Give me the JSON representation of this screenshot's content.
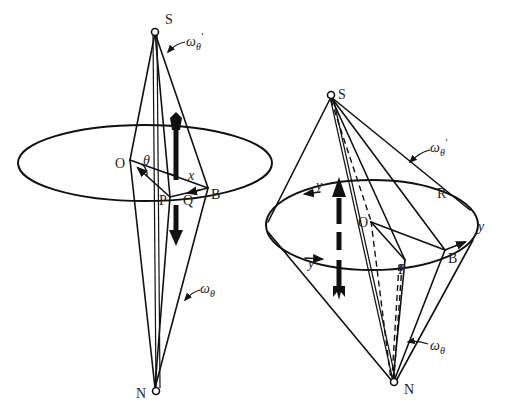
{
  "figure": {
    "left_diagram": {
      "labels": {
        "top_pole": "S",
        "bottom_pole": "N",
        "center": "O",
        "point_p": "P",
        "point_q": "Q",
        "point_b": "B",
        "angle": "θ",
        "distance": "x",
        "omega_top": "ω",
        "omega_top_sub": "θ",
        "omega_top_prime": "′",
        "omega_bottom": "ω",
        "omega_bottom_sub": "θ"
      }
    },
    "right_diagram": {
      "labels": {
        "top_pole": "S",
        "bottom_pole": "N",
        "center": "O",
        "point_p": "P",
        "point_b": "B",
        "point_r": "R",
        "y_left_top": "y",
        "y_left_bottom": "y",
        "y_right": "y",
        "omega_top": "ω",
        "omega_top_sub": "θ",
        "omega_top_prime": "′",
        "omega_bottom": "ω",
        "omega_bottom_sub": "θ"
      }
    }
  }
}
